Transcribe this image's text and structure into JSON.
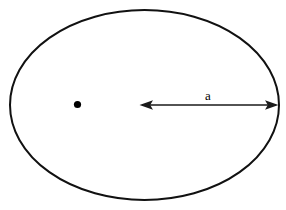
{
  "figure": {
    "background_color": "#ffffff",
    "width": 286,
    "height": 210
  },
  "ellipse": {
    "name": "ellipse-outline",
    "center_x": 144.5,
    "center_y": 105,
    "radius_x": 134.5,
    "radius_y": 95,
    "stroke_color": "#111111",
    "stroke_width": 2,
    "fill": "none"
  },
  "focus_point": {
    "label": "",
    "center_x": 77.5,
    "center_y": 104.5,
    "radius": 3.6,
    "color": "#000000"
  },
  "dimension": {
    "label": "a",
    "label_x": 208,
    "label_y": 100,
    "line_y": 105,
    "start_x": 140,
    "end_x": 278,
    "color": "#1a1a1a",
    "arrow_both_ends": true
  },
  "watermark": {
    "text": "",
    "color": "#e8e8ea"
  }
}
